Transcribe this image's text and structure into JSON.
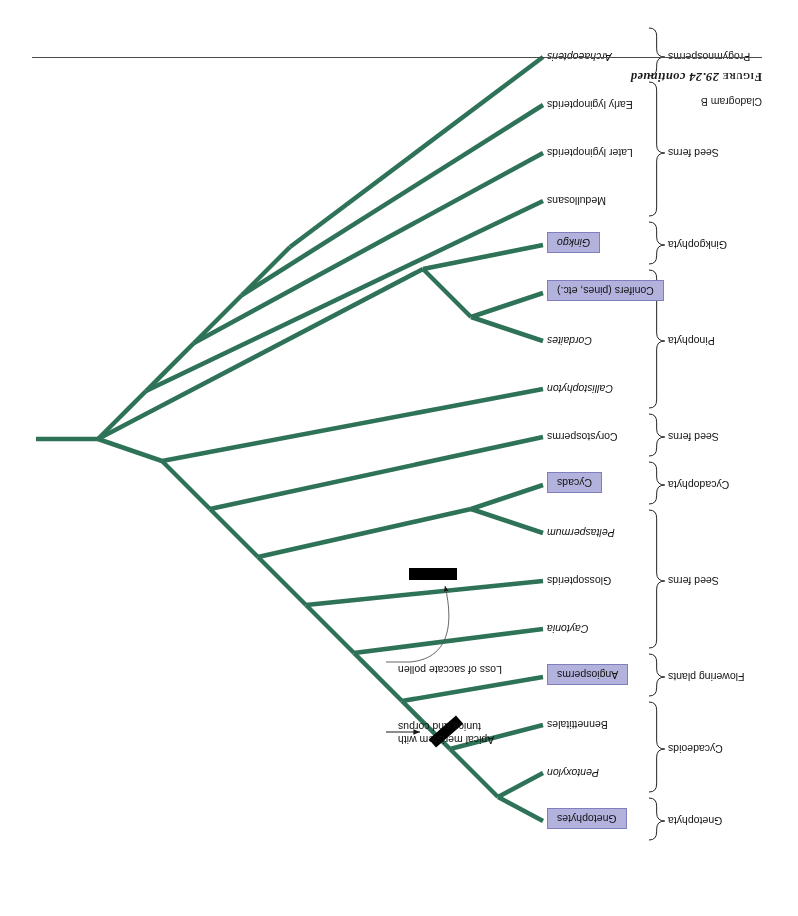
{
  "page": {
    "figure_caption_smallcaps": "Figure",
    "figure_caption_rest": " 29.24 continued",
    "subtitle": "Cladogram B"
  },
  "colors": {
    "branch_green": "#2e7257",
    "box_fill": "#b2b2dd",
    "box_border": "#7f7fbe",
    "synapomorphy_bar": "#000000",
    "text": "#111111",
    "leader_line": "#555555"
  },
  "taxa": [
    {
      "label": "Gnetophytes",
      "boxed": true,
      "italic": false,
      "y": 95
    },
    {
      "label": "Pentoxylon",
      "boxed": false,
      "italic": true,
      "y": 143
    },
    {
      "label": "Bennettitales",
      "boxed": false,
      "italic": false,
      "y": 191
    },
    {
      "label": "Angiosperms",
      "boxed": true,
      "italic": false,
      "y": 239
    },
    {
      "label": "Caytonia",
      "boxed": false,
      "italic": true,
      "y": 287
    },
    {
      "label": "Glossopterids",
      "boxed": false,
      "italic": false,
      "y": 335
    },
    {
      "label": "Peltaspermum",
      "boxed": false,
      "italic": true,
      "y": 383
    },
    {
      "label": "Cycads",
      "boxed": true,
      "italic": false,
      "y": 431
    },
    {
      "label": "Corystosperms",
      "boxed": false,
      "italic": false,
      "y": 479
    },
    {
      "label": "Callistophyton",
      "boxed": false,
      "italic": true,
      "y": 527
    },
    {
      "label": "Cordaites",
      "boxed": false,
      "italic": true,
      "y": 575
    },
    {
      "label": "Conifers (pines, etc.)",
      "boxed": true,
      "italic": false,
      "y": 623
    },
    {
      "label": "Ginkgo",
      "boxed": true,
      "italic": true,
      "y": 671
    },
    {
      "label": "Medullosans",
      "boxed": false,
      "italic": false,
      "y": 715
    },
    {
      "label": "Later lyginopterids",
      "boxed": false,
      "italic": false,
      "y": 763
    },
    {
      "label": "Early lyginopterids",
      "boxed": false,
      "italic": false,
      "y": 811
    },
    {
      "label": "Archaeopteris",
      "boxed": false,
      "italic": true,
      "y": 859
    }
  ],
  "groups": [
    {
      "label": "Gnetophyta",
      "y": 95,
      "top": 76,
      "bottom": 118
    },
    {
      "label": "Cycadeoids",
      "y": 167,
      "top": 124,
      "bottom": 214
    },
    {
      "label": "Flowering plants",
      "y": 239,
      "top": 220,
      "bottom": 262
    },
    {
      "label": "Seed ferns",
      "y": 335,
      "top": 268,
      "bottom": 406
    },
    {
      "label": "Cycadophyta",
      "y": 431,
      "top": 412,
      "bottom": 454
    },
    {
      "label": "Seed ferns",
      "y": 479,
      "top": 460,
      "bottom": 502
    },
    {
      "label": "Pinophyta",
      "y": 575,
      "top": 508,
      "bottom": 646
    },
    {
      "label": "Ginkgophyta",
      "y": 671,
      "top": 652,
      "bottom": 694
    },
    {
      "label": "Seed ferns",
      "y": 763,
      "top": 700,
      "bottom": 834
    },
    {
      "label": "Progymnosperms",
      "y": 859,
      "top": 840,
      "bottom": 888
    }
  ],
  "annotations": [
    {
      "id": "apical-meristem",
      "lines": [
        "Apical meristem with",
        "tunica and corpus"
      ],
      "text_x": 400,
      "text_y": 170,
      "arrow": "straight"
    },
    {
      "id": "saccate-pollen",
      "lines": [
        "Loss of saccate pollen"
      ],
      "text_x": 400,
      "text_y": 240,
      "arrow": "curved"
    }
  ],
  "synapomorphy_bars": [
    {
      "id": "bar-apical-meristem",
      "x": 352,
      "y": 184,
      "width": 36,
      "height": 11,
      "rotation": -41
    },
    {
      "id": "bar-saccate-pollen",
      "x": 365,
      "y": 342,
      "width": 48,
      "height": 12,
      "rotation": 0
    }
  ],
  "chart_data": {
    "type": "cladogram",
    "title": "Cladogram B",
    "orientation": "upside-down, tips at left, root at right",
    "root": {
      "x": 700,
      "y": 477,
      "stem_to_x": 762
    },
    "tip_x": 255,
    "topology": "(Archaeopteris,(Early lyginopterids,(Later lyginopterids,(Medullosans,((Ginkgo,(Conifers,Cordaites)),(Callistophyton,(Corystosperms,((Cycads,Peltaspermum),(Glossopterids,(Caytonia,(Angiosperms,(Bennettitales,(Pentoxylon,Gnetophytes)))))))))))))",
    "nodes": [
      {
        "name": "gnetophytes-pentoxylon",
        "children": [
          "Gnetophytes",
          "Pentoxylon"
        ],
        "apex_x": 300,
        "apex_y": 119
      },
      {
        "name": "bennettitales-clade",
        "children": [
          "gnetophytes-pentoxylon",
          "Bennettitales"
        ],
        "apex_x": 348,
        "apex_y": 167
      },
      {
        "name": "angiosperm-clade",
        "children": [
          "bennettitales-clade",
          "Angiosperms"
        ],
        "apex_x": 396,
        "apex_y": 215
      },
      {
        "name": "caytonia-clade",
        "children": [
          "angiosperm-clade",
          "Caytonia"
        ],
        "apex_x": 444,
        "apex_y": 263
      },
      {
        "name": "glossopterid-clade",
        "children": [
          "caytonia-clade",
          "Glossopterids"
        ],
        "apex_x": 492,
        "apex_y": 311
      },
      {
        "name": "cycad-peltaspermum",
        "children": [
          "Peltaspermum",
          "Cycads"
        ],
        "apex_x": 327,
        "apex_y": 407
      },
      {
        "name": "cycad-glossopterid-clade",
        "children": [
          "glossopterid-clade",
          "cycad-peltaspermum"
        ],
        "apex_x": 540,
        "apex_y": 359
      },
      {
        "name": "corystosperm-clade",
        "children": [
          "cycad-glossopterid-clade",
          "Corystosperms"
        ],
        "apex_x": 588,
        "apex_y": 407
      },
      {
        "name": "callistophyton-clade",
        "children": [
          "corystosperm-clade",
          "Callistophyton"
        ],
        "apex_x": 636,
        "apex_y": 455
      },
      {
        "name": "conifer-cordaites",
        "children": [
          "Cordaites",
          "Conifers (pines, etc.)"
        ],
        "apex_x": 327,
        "apex_y": 599
      },
      {
        "name": "ginkgo-conifer-clade",
        "children": [
          "conifer-cordaites",
          "Ginkgo"
        ],
        "apex_x": 375,
        "apex_y": 647
      },
      {
        "name": "seed-plants",
        "children": [
          "callistophyton-clade",
          "ginkgo-conifer-clade"
        ],
        "apex_x": 700,
        "apex_y": 477
      },
      {
        "name": "medullosan-clade",
        "children": [
          "seed-plants",
          "Medullosans"
        ],
        "apex_x": 652,
        "apex_y": 525
      },
      {
        "name": "later-lyginopterid-clade",
        "children": [
          "medullosan-clade",
          "Later lyginopterids"
        ],
        "apex_x": 604,
        "apex_y": 573
      },
      {
        "name": "early-lyginopterid-clade",
        "children": [
          "later-lyginopterid-clade",
          "Early lyginopterids"
        ],
        "apex_x": 556,
        "apex_y": 621
      },
      {
        "name": "archaeopteris-clade",
        "children": [
          "early-lyginopterid-clade",
          "Archaeopteris"
        ],
        "apex_x": 508,
        "apex_y": 669
      }
    ],
    "character_marks": [
      {
        "label": "Apical meristem with tunica and corpus",
        "on_branch": "bennettitales-clade"
      },
      {
        "label": "Loss of saccate pollen",
        "on_branch": "glossopterid-clade"
      }
    ]
  }
}
